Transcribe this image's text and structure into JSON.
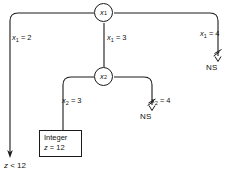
{
  "diagram": {
    "type": "decision-tree",
    "background_color": "#ffffff",
    "line_color": "#1a1a1a",
    "text_color": "#111111",
    "nodes": [
      {
        "id": "x1",
        "label": "x",
        "subscript": "1",
        "x": 104,
        "y": 13
      },
      {
        "id": "x2",
        "label": "x",
        "subscript": "2",
        "x": 104,
        "y": 77
      }
    ],
    "edges": [
      {
        "id": "x1-eq-2",
        "from": "x1",
        "label_var": "x",
        "label_sub": "1",
        "label_rel": " = 2",
        "label_x": 12,
        "label_y": 34,
        "terminates_in": "outcome"
      },
      {
        "id": "x1-eq-3",
        "from": "x1",
        "label_var": "x",
        "label_sub": "1",
        "label_rel": " = 3",
        "label_x": 107,
        "label_y": 34,
        "terminates_in": "node-x2"
      },
      {
        "id": "x1-eq-4",
        "from": "x1",
        "label_var": "x",
        "label_sub": "1",
        "label_rel": " = 4",
        "label_x": 200,
        "label_y": 30,
        "terminates_in": "ns-right"
      },
      {
        "id": "x2-eq-3",
        "from": "x2",
        "label_var": "x",
        "label_sub": "2",
        "label_rel": " = 3",
        "label_x": 62,
        "label_y": 97,
        "terminates_in": "integer-box"
      },
      {
        "id": "x2-eq-4",
        "from": "x2",
        "label_var": "x",
        "label_sub": "2",
        "label_rel": " = 4",
        "label_x": 151,
        "label_y": 97,
        "terminates_in": "ns-middle"
      }
    ],
    "terminals": [
      {
        "id": "ns-right",
        "text": "NS",
        "x": 206,
        "y": 68
      },
      {
        "id": "ns-middle",
        "text": "NS",
        "x": 140,
        "y": 117
      }
    ],
    "leaf_box": {
      "id": "integer-box",
      "line1": "Integer",
      "line2_var": "z",
      "line2_rel": " = 12",
      "x": 39,
      "y": 130,
      "width": 43,
      "height": 25
    },
    "outcome": {
      "id": "z-lt-12",
      "var": "z",
      "rel": " < 12",
      "x": 4,
      "y": 162
    }
  }
}
